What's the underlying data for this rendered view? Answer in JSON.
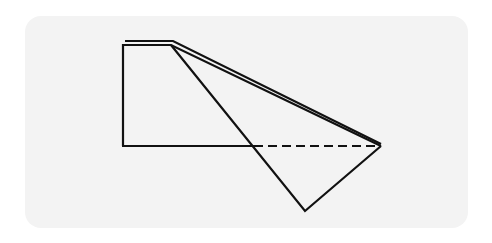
{
  "diagram": {
    "type": "folded paper / origami fold step",
    "colors": {
      "background": "#ffffff",
      "panel": "#f3f3f3",
      "stroke": "#111111"
    },
    "shapes": {
      "rectangle_flap": {
        "points": [
          [
            123,
            45
          ],
          [
            123,
            146
          ],
          [
            254,
            146
          ]
        ],
        "description": "left rectangular portion with solid bottom edge"
      },
      "top_double_edge": {
        "description": "double line along top edge indicating layered paper"
      },
      "folded_triangle": {
        "points": [
          [
            171,
            44
          ],
          [
            381,
            146
          ],
          [
            305,
            211
          ]
        ],
        "description": "large triangle folded down"
      },
      "fold_line": {
        "from": [
          254,
          146
        ],
        "to": [
          381,
          146
        ],
        "style": "dashed",
        "description": "valley/hidden edge"
      }
    },
    "labels": []
  }
}
